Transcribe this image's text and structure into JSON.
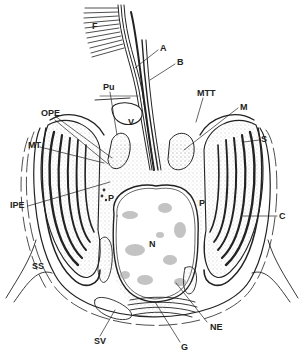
{
  "diagram": {
    "colors": {
      "line": "#222222",
      "stipple": "#888888",
      "chromatin": "#aaaaaa",
      "background": "#ffffff"
    },
    "labels": [
      {
        "id": "F",
        "text": "F",
        "x": 92,
        "y": 27
      },
      {
        "id": "A",
        "text": "A",
        "x": 160,
        "y": 49
      },
      {
        "id": "B",
        "text": "B",
        "x": 177,
        "y": 63
      },
      {
        "id": "Pu",
        "text": "Pu",
        "x": 103,
        "y": 85
      },
      {
        "id": "MTT",
        "text": "MTT",
        "x": 197,
        "y": 92
      },
      {
        "id": "M",
        "text": "M",
        "x": 240,
        "y": 106
      },
      {
        "id": "OPE",
        "text": "OPE",
        "x": 41,
        "y": 111
      },
      {
        "id": "V",
        "text": "V",
        "x": 128,
        "y": 123
      },
      {
        "id": "S",
        "text": "S",
        "x": 261,
        "y": 137
      },
      {
        "id": "MT",
        "text": "MT",
        "x": 28,
        "y": 143
      },
      {
        "id": "P_left",
        "text": "P",
        "x": 108,
        "y": 195
      },
      {
        "id": "P_right",
        "text": "P",
        "x": 199,
        "y": 200
      },
      {
        "id": "IPE",
        "text": "IPE",
        "x": 10,
        "y": 203
      },
      {
        "id": "C",
        "text": "C",
        "x": 279,
        "y": 213
      },
      {
        "id": "N",
        "text": "N",
        "x": 149,
        "y": 242
      },
      {
        "id": "SS",
        "text": "SS",
        "x": 32,
        "y": 262
      },
      {
        "id": "NE",
        "text": "NE",
        "x": 210,
        "y": 326
      },
      {
        "id": "SV",
        "text": "SV",
        "x": 94,
        "y": 338
      },
      {
        "id": "G",
        "text": "G",
        "x": 181,
        "y": 345
      }
    ]
  }
}
